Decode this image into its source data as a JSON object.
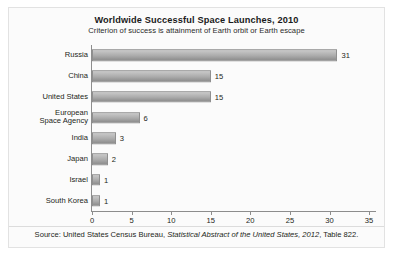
{
  "chart_data": {
    "type": "bar",
    "orientation": "horizontal",
    "title": "Worldwide Successful Space Launches, 2010",
    "subtitle": "Criterion of success is attainment of Earth orbit or Earth escape",
    "xlabel": "",
    "ylabel": "",
    "xlim": [
      0,
      36
    ],
    "xticks": [
      "0",
      "5",
      "10",
      "15",
      "20",
      "25",
      "30",
      "35"
    ],
    "xtick_values": [
      0,
      5,
      10,
      15,
      20,
      25,
      30,
      35
    ],
    "grid": false,
    "legend": false,
    "bar_color": "#ababab",
    "bar_edge_color": "#8f8f8f",
    "categories": [
      "Russia",
      "China",
      "United States",
      "European\nSpace Agency",
      "India",
      "Japan",
      "Israel",
      "South Korea"
    ],
    "values": [
      31,
      15,
      15,
      6,
      3,
      2,
      1,
      1
    ],
    "value_labels": [
      "31",
      "15",
      "15",
      "6",
      "3",
      "2",
      "1",
      "1"
    ]
  },
  "source": {
    "prefix": "Source: United States Census Bureau, ",
    "italic": "Statistical Abstract of the United States, 2012",
    "suffix": ", Table 822."
  }
}
